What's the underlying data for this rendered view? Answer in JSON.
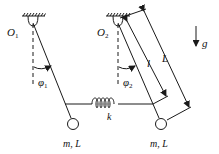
{
  "diagram": {
    "pivots": [
      {
        "label": "O",
        "sub": "1"
      },
      {
        "label": "O",
        "sub": "2"
      }
    ],
    "angles": [
      {
        "label": "φ",
        "sub": "1"
      },
      {
        "label": "φ",
        "sub": "2"
      }
    ],
    "spring": {
      "label": "k"
    },
    "bobs": [
      {
        "label": "m, L"
      },
      {
        "label": "m, L"
      }
    ],
    "dimensions": {
      "short_length": "l",
      "long_length": "L"
    },
    "gravity": {
      "label": "g"
    },
    "colors": {
      "stroke": "#1a1a1a",
      "background": "#ffffff"
    }
  }
}
